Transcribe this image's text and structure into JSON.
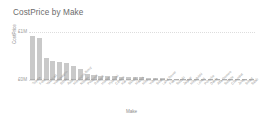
{
  "chart_title": "CostPrice by Make",
  "axes": {
    "y_title": "CostPrice",
    "x_title": "Make",
    "y_tick_top": "£1M",
    "y_tick_bottom": "£0M"
  },
  "chart_data": {
    "type": "bar",
    "title": "CostPrice by Make",
    "xlabel": "Make",
    "ylabel": "CostPrice",
    "ylim": [
      0,
      1000000
    ],
    "grid": true,
    "legend": "none",
    "orientation": "vertical",
    "tick_labels_y": [
      "£0M",
      "£1M"
    ],
    "categories": [
      "Toyota",
      "Ford",
      "Vauxhall",
      "Volkswagen",
      "BMW",
      "Audi",
      "Mercedes-Benz",
      "Nissan",
      "Peugeot",
      "Renault",
      "Honda",
      "Hyundai",
      "Citroen",
      "Kia",
      "Skoda",
      "Mazda",
      "Mini",
      "Volvo",
      "Seat",
      "Land Rover",
      "Fiat",
      "Suzuki",
      "Jaguar",
      "Mitsubishi",
      "Lexus",
      "Porsche",
      "Dacia",
      "Alfa Romeo",
      "Subaru",
      "Chevrolet",
      "Jeep",
      "Smart",
      "Saab"
    ],
    "values": [
      920000,
      870000,
      470000,
      400000,
      395000,
      375000,
      300000,
      250000,
      135000,
      120000,
      112000,
      105000,
      98000,
      92000,
      86000,
      80000,
      74000,
      68000,
      60000,
      54000,
      48000,
      42000,
      37000,
      32000,
      28000,
      24000,
      20000,
      17000,
      14000,
      11000,
      8000,
      5000,
      3000
    ]
  },
  "colors": {
    "bar": "#c9c9c9",
    "bar_base": "#b0b0b0",
    "text": "#6b6b6b",
    "axis_text": "#9a9a9a",
    "gridline": "#dddddd",
    "background": "#ffffff"
  }
}
